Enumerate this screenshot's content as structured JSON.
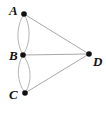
{
  "diagram": {
    "type": "geometry-line-drawing",
    "canvas": {
      "width": 106,
      "height": 113,
      "background": "#ffffff"
    },
    "colors": {
      "point_fill": "#111111",
      "straight_line": "#a8a8a8",
      "arc_line": "#b4b4b4",
      "label_text": "#111111"
    },
    "points": [
      {
        "id": "A",
        "label": "A",
        "x": 24,
        "y": 14,
        "radius": 2.8,
        "label_x": 9,
        "label_y": 4
      },
      {
        "id": "B",
        "label": "B",
        "x": 23,
        "y": 55,
        "radius": 2.8,
        "label_x": 9,
        "label_y": 49
      },
      {
        "id": "C",
        "label": "C",
        "x": 25,
        "y": 93,
        "radius": 2.8,
        "label_x": 9,
        "label_y": 88
      },
      {
        "id": "D",
        "label": "D",
        "x": 89,
        "y": 54,
        "radius": 2.8,
        "label_x": 93,
        "label_y": 55
      }
    ],
    "straight_edges": [
      {
        "id": "AD",
        "from": "A",
        "to": "D",
        "x1": 24,
        "y1": 14,
        "x2": 89,
        "y2": 54
      },
      {
        "id": "BD",
        "from": "B",
        "to": "D",
        "x1": 23,
        "y1": 55,
        "x2": 89,
        "y2": 54
      },
      {
        "id": "CD",
        "from": "C",
        "to": "D",
        "x1": 25,
        "y1": 93,
        "x2": 89,
        "y2": 54
      }
    ],
    "arcs": [
      {
        "id": "AB-left",
        "from": "A",
        "to": "B",
        "path": "M 24 14 C 16 26 16 43 23 55"
      },
      {
        "id": "AB-right",
        "from": "A",
        "to": "B",
        "path": "M 24 14 C 31 26 31 43 23 55"
      },
      {
        "id": "BC-left",
        "from": "B",
        "to": "C",
        "path": "M 23 55 C 16 67 17 82 25 93"
      },
      {
        "id": "BC-right",
        "from": "B",
        "to": "C",
        "path": "M 23 55 C 32 67 32 82 25 93"
      }
    ]
  }
}
